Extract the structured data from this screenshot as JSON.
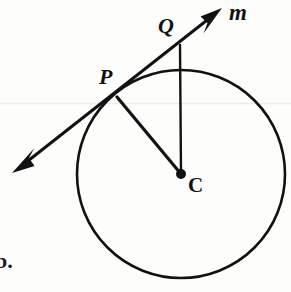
{
  "figure": {
    "background_color": "#fdfdfc",
    "ink_color": "#111111",
    "width": 291,
    "height": 292
  },
  "labels": {
    "point_p": "P",
    "point_q": "Q",
    "point_c": "C",
    "line_m": "m",
    "margin_item": "b."
  },
  "chart_data": {
    "type": "diagram",
    "subtype": "euclidean-geometry",
    "coordinate_space": {
      "width": 291,
      "height": 292,
      "origin": "top-left"
    },
    "circle": {
      "name": "circle-C",
      "center_label": "C",
      "center": [
        181,
        174
      ],
      "radius": 104,
      "stroke_width": 2.6,
      "fill": "none"
    },
    "points": [
      {
        "label": "C",
        "x": 181,
        "y": 174,
        "marker": "filled-dot",
        "marker_radius": 5,
        "role": "center"
      },
      {
        "label": "P",
        "x": 117,
        "y": 97,
        "marker": "none",
        "role": "tangent-point-on-circle"
      },
      {
        "label": "Q",
        "x": 180,
        "y": 45,
        "marker": "none",
        "role": "external-point-on-line-m"
      }
    ],
    "segments": [
      {
        "name": "radius-PC",
        "from": "P",
        "to": "C",
        "from_xy": [
          117,
          97
        ],
        "to_xy": [
          181,
          174
        ],
        "stroke_width": 3.2
      },
      {
        "name": "segment-QC",
        "from": "Q",
        "to": "C",
        "from_xy": [
          180,
          45
        ],
        "to_xy": [
          181,
          174
        ],
        "stroke_width": 2.4
      }
    ],
    "lines": [
      {
        "name": "tangent-line-m",
        "label": "m",
        "kind": "double-headed-arrow",
        "passes_through": [
          "P",
          "Q"
        ],
        "start_xy": [
          13,
          173
        ],
        "end_xy": [
          222,
          9
        ],
        "stroke_width": 3.0,
        "arrowheads": [
          "start",
          "end"
        ],
        "relationship": "tangent to circle-C at point P"
      }
    ],
    "annotations": [
      {
        "text": "P",
        "x": 99,
        "y": 66,
        "style": "bold-italic-serif"
      },
      {
        "text": "Q",
        "x": 158,
        "y": 15,
        "style": "bold-italic-serif"
      },
      {
        "text": "C",
        "x": 188,
        "y": 175,
        "style": "bold-upright-serif"
      },
      {
        "text": "m",
        "x": 229,
        "y": 1,
        "style": "bold-italic-serif"
      },
      {
        "text": "b.",
        "x": -5,
        "y": 248,
        "style": "bold-serif-cropped"
      }
    ],
    "relationships": [
      "line m is tangent to circle C at point P",
      "radius CP is perpendicular to tangent line m",
      "Q lies on line m outside the circle",
      "segment QC is drawn from Q to center C"
    ]
  }
}
